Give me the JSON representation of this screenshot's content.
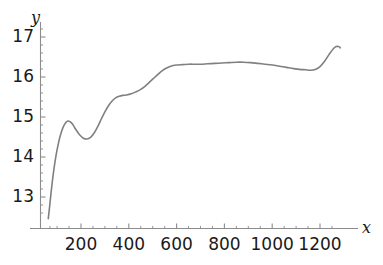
{
  "chart_data": {
    "type": "line",
    "title": "",
    "xlabel": "x",
    "ylabel": "y",
    "xlim": [
      60,
      1290
    ],
    "ylim": [
      12.45,
      17.25
    ],
    "grid": false,
    "legend": false,
    "axis_color": "#8c8c8c",
    "line_color": "#808080",
    "line_width": 1.6,
    "x_ticks": [
      200,
      400,
      600,
      800,
      1000,
      1200
    ],
    "x_tick_labels": [
      "200",
      "400",
      "600",
      "800",
      "1000",
      "1200"
    ],
    "x_minor_tick_step": 50,
    "y_ticks": [
      13,
      14,
      15,
      16,
      17
    ],
    "y_tick_labels": [
      "13",
      "14",
      "15",
      "16",
      "17"
    ],
    "y_minor_tick_step": 0.2,
    "series": [
      {
        "name": "curve",
        "x": [
          63,
          68,
          75,
          85,
          95,
          105,
          115,
          125,
          135,
          145,
          155,
          165,
          175,
          185,
          195,
          210,
          225,
          240,
          255,
          270,
          285,
          300,
          315,
          330,
          345,
          360,
          375,
          390,
          410,
          430,
          450,
          470,
          490,
          510,
          530,
          550,
          575,
          600,
          625,
          650,
          675,
          700,
          730,
          760,
          790,
          820,
          850,
          880,
          910,
          940,
          970,
          1000,
          1030,
          1060,
          1090,
          1115,
          1140,
          1160,
          1180,
          1200,
          1220,
          1240,
          1255,
          1268,
          1278,
          1285
        ],
        "y": [
          12.46,
          12.72,
          13.12,
          13.62,
          14.02,
          14.33,
          14.57,
          14.74,
          14.85,
          14.9,
          14.88,
          14.82,
          14.72,
          14.63,
          14.55,
          14.47,
          14.45,
          14.49,
          14.6,
          14.76,
          14.95,
          15.13,
          15.28,
          15.4,
          15.48,
          15.52,
          15.54,
          15.55,
          15.58,
          15.63,
          15.69,
          15.78,
          15.89,
          16.0,
          16.11,
          16.2,
          16.27,
          16.3,
          16.31,
          16.32,
          16.32,
          16.32,
          16.33,
          16.34,
          16.35,
          16.36,
          16.37,
          16.37,
          16.36,
          16.34,
          16.32,
          16.3,
          16.27,
          16.24,
          16.21,
          16.19,
          16.18,
          16.17,
          16.19,
          16.26,
          16.4,
          16.58,
          16.7,
          16.76,
          16.76,
          16.73
        ]
      }
    ]
  },
  "axes": {
    "x_axis_name": "x",
    "y_axis_name": "y"
  }
}
